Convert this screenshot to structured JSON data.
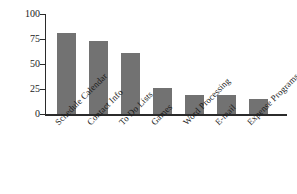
{
  "chart_data": {
    "type": "bar",
    "title": "",
    "xlabel": "",
    "ylabel": "% Positive Responses",
    "ylim": [
      0,
      100
    ],
    "yticks": [
      0,
      25,
      50,
      75,
      100
    ],
    "grid": false,
    "legend": null,
    "bar_color": "#727272",
    "axis_color": "#2b2b2b",
    "categories": [
      "Schedule Calendar",
      "Contact Info",
      "To Do Lists",
      "Games",
      "Word Processing",
      "E-mail",
      "Expense Programs"
    ],
    "values": [
      81,
      73,
      61,
      26,
      19,
      19,
      15
    ]
  }
}
